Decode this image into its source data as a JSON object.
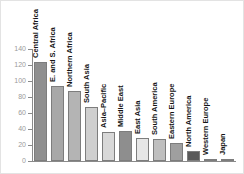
{
  "chart_data": {
    "type": "bar",
    "title": "",
    "xlabel": "",
    "ylabel": "",
    "ylim": [
      0,
      140
    ],
    "yticks": [
      0,
      20,
      40,
      60,
      80,
      100,
      120,
      140
    ],
    "grid": false,
    "legend": "none",
    "categories": [
      "Central Africa",
      "E. and S. Africa",
      "Northern Africa",
      "South Asia",
      "Asia–Pacific",
      "Middle East",
      "East Asia",
      "South America",
      "Eastern Europe",
      "North America",
      "Western Europe",
      "Japan"
    ],
    "values": [
      124,
      94,
      88,
      67,
      36,
      38,
      29,
      27,
      23,
      12,
      3,
      2
    ],
    "bar_colors": [
      "#8f8f8f",
      "#a8a8a8",
      "#b4b4b4",
      "#cfcfcf",
      "#d8d8d8",
      "#8e8e8e",
      "#e6e6e6",
      "#bfbfbf",
      "#9f9f9f",
      "#5a5a5a",
      "#6e6e6e",
      "#8b8b8b"
    ]
  },
  "axis": {
    "line_color": "#8a8a8a",
    "tick_label_color": "#9a9a9a"
  },
  "frame": {
    "border_color": "#e3e3e3",
    "background": "#ffffff"
  }
}
